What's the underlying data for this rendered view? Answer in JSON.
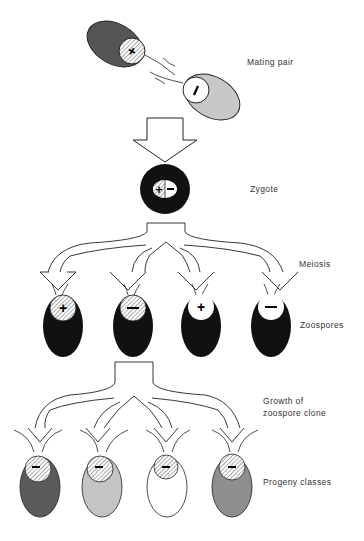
{
  "labels": {
    "mating_pair": "Mating pair",
    "zygote": "Zygote",
    "meiosis": "Meiosis",
    "zoospores": "Zoospores",
    "growth_line1": "Growth of",
    "growth_line2": "zoospore clone",
    "progeny": "Progeny classes"
  },
  "mating_pair": {
    "cell1": {
      "sign": "+",
      "body_color": "#555555",
      "nucleus": "hatched"
    },
    "cell2": {
      "sign": "−",
      "body_color": "#c8c8c8",
      "nucleus": "white"
    }
  },
  "zygote": {
    "signs": "+|−",
    "body_color": "#111111"
  },
  "zoospores": [
    {
      "sign": "+",
      "nucleus": "hatched",
      "body_color": "#111111"
    },
    {
      "sign": "−",
      "nucleus": "hatched",
      "body_color": "#111111"
    },
    {
      "sign": "+",
      "nucleus": "white",
      "body_color": "#111111"
    },
    {
      "sign": "−",
      "nucleus": "white",
      "body_color": "#111111"
    }
  ],
  "progeny": [
    {
      "sign": "−",
      "nucleus": "hatched",
      "body_color": "#5a5a5a"
    },
    {
      "sign": "−",
      "nucleus": "hatched",
      "body_color": "#c4c4c4"
    },
    {
      "sign": "−",
      "nucleus": "hatched",
      "body_color": "#ffffff"
    },
    {
      "sign": "−",
      "nucleus": "hatched",
      "body_color": "#8e8e8e"
    }
  ]
}
